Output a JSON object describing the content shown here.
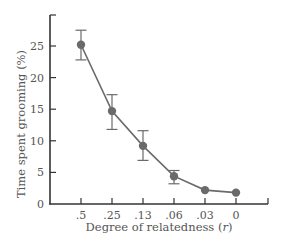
{
  "chart_data": {
    "type": "line",
    "title": "",
    "xlabel": "Degree of relatedness (r)",
    "xlabel_prefix": "Degree of relatedness (",
    "xlabel_var": "r",
    "xlabel_suffix": ")",
    "ylabel": "Time spent grooming (%)",
    "categories": [
      ".5",
      ".25",
      ".13",
      ".06",
      ".03",
      "0"
    ],
    "series": [
      {
        "name": "Time spent grooming",
        "values": [
          25.2,
          14.7,
          9.2,
          4.4,
          2.2,
          1.8
        ],
        "error_low": [
          22.8,
          11.8,
          6.9,
          3.2,
          null,
          null
        ],
        "error_high": [
          27.5,
          17.3,
          11.6,
          5.3,
          null,
          null
        ]
      }
    ],
    "yticks": [
      0,
      5,
      10,
      15,
      20,
      25
    ],
    "ylim": [
      0,
      30
    ],
    "grid": false,
    "legend": "none",
    "colors": {
      "line": "#6a6a6a",
      "marker": "#6a6a6a",
      "axis": "#333333",
      "text": "#555555"
    }
  }
}
